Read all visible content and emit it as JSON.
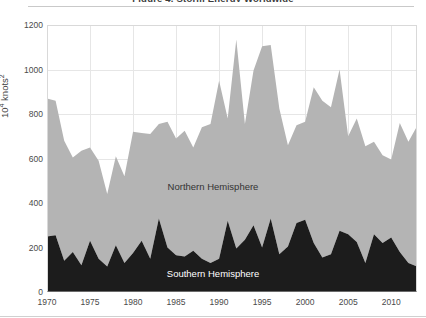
{
  "figure": {
    "title": "Figure 4. Storm Energy Worldwide",
    "ylabel_main": "10",
    "ylabel_sup": "4",
    "ylabel_tail": " knots",
    "ylabel_tail_sup": "2"
  },
  "labels": {
    "northern": "Northern Hemisphere",
    "southern": "Southern Hemisphere"
  },
  "colors": {
    "northern_fill": "#b4b4b4",
    "southern_fill": "#1c1c1c",
    "grid": "#e6e6e6",
    "axis": "#6b6b6b",
    "text": "#4a4a4a",
    "background": "#ffffff"
  },
  "chart_data": {
    "type": "area",
    "stacked": true,
    "title": "Figure 4. Storm Energy Worldwide",
    "xlabel": "",
    "ylabel": "10^4 knots^2",
    "xlim": [
      1970,
      2013
    ],
    "ylim": [
      0,
      1200
    ],
    "grid": true,
    "legend": "inline-annotations",
    "x": [
      1970,
      1971,
      1972,
      1973,
      1974,
      1975,
      1976,
      1977,
      1978,
      1979,
      1980,
      1981,
      1982,
      1983,
      1984,
      1985,
      1986,
      1987,
      1988,
      1989,
      1990,
      1991,
      1992,
      1993,
      1994,
      1995,
      1996,
      1997,
      1998,
      1999,
      2000,
      2001,
      2002,
      2003,
      2004,
      2005,
      2006,
      2007,
      2008,
      2009,
      2010,
      2011,
      2012,
      2013
    ],
    "ytick_labels": [
      "0",
      "200",
      "400",
      "600",
      "800",
      "1000",
      "1200"
    ],
    "ytick_values": [
      0,
      200,
      400,
      600,
      800,
      1000,
      1200
    ],
    "xtick_labels": [
      "1970",
      "1975",
      "1980",
      "1985",
      "1990",
      "1995",
      "2000",
      "2005",
      "2010"
    ],
    "xtick_values": [
      1970,
      1975,
      1980,
      1985,
      1990,
      1995,
      2000,
      2005,
      2010
    ],
    "series": [
      {
        "name": "Southern Hemisphere",
        "color": "#1c1c1c",
        "values": [
          250,
          255,
          140,
          180,
          120,
          230,
          150,
          115,
          210,
          130,
          175,
          230,
          150,
          330,
          200,
          165,
          160,
          185,
          150,
          130,
          150,
          320,
          195,
          235,
          300,
          200,
          330,
          170,
          205,
          310,
          325,
          220,
          155,
          170,
          275,
          260,
          225,
          130,
          260,
          220,
          245,
          180,
          130,
          115
        ]
      },
      {
        "name": "Northern Hemisphere",
        "color": "#b4b4b4",
        "values": [
          620,
          605,
          540,
          425,
          515,
          420,
          440,
          325,
          400,
          390,
          545,
          485,
          560,
          425,
          565,
          525,
          565,
          465,
          590,
          625,
          800,
          460,
          940,
          520,
          695,
          905,
          780,
          655,
          455,
          440,
          440,
          700,
          705,
          660,
          725,
          440,
          555,
          525,
          415,
          395,
          350,
          580,
          545,
          630
        ]
      }
    ],
    "totals": [
      870,
      860,
      680,
      605,
      635,
      650,
      590,
      440,
      610,
      520,
      720,
      715,
      710,
      755,
      765,
      690,
      725,
      650,
      740,
      755,
      950,
      780,
      1135,
      755,
      995,
      1105,
      1110,
      825,
      660,
      750,
      765,
      920,
      860,
      830,
      1000,
      700,
      780,
      655,
      675,
      615,
      595,
      760,
      675,
      745
    ]
  }
}
